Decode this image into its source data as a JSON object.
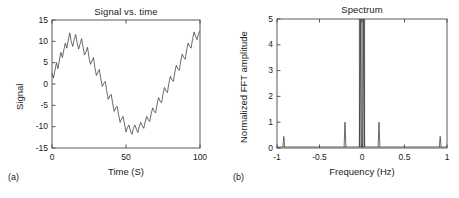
{
  "figure": {
    "panels": [
      {
        "tag": "(a)",
        "title": "Signal vs. time",
        "xlabel": "Time (S)",
        "ylabel": "Signal"
      },
      {
        "tag": "(b)",
        "title": "Spectrum",
        "xlabel": "Frequency (Hz)",
        "ylabel": "Normalized FFT amplitude"
      }
    ],
    "style": {
      "line_color": "#3a3a3a",
      "axis_color": "#4a4a4a",
      "background": "#ffffff"
    }
  },
  "chart_data": [
    {
      "type": "line",
      "id": "signal-vs-time",
      "title": "Signal vs. time",
      "xlabel": "Time (S)",
      "ylabel": "Signal",
      "xlim": [
        0,
        100
      ],
      "ylim": [
        -15,
        15
      ],
      "xticks": [
        0,
        50,
        100
      ],
      "xticklabels": [
        "0",
        "50",
        "100"
      ],
      "yticks": [
        -15,
        -10,
        -5,
        0,
        5,
        10,
        15
      ],
      "yticklabels": [
        "-15",
        "-10",
        "-5",
        "0",
        "5",
        "10",
        "15"
      ],
      "grid": false,
      "legend": null,
      "description": "Noisy sinusoid: ~0.02 Hz fundamental of amplitude ~10 plus a ~0.2 Hz ripple of amplitude ~2 and random noise.",
      "x": [
        0,
        1,
        2,
        3,
        4,
        5,
        6,
        7,
        8,
        9,
        10,
        11,
        12,
        13,
        14,
        15,
        16,
        17,
        18,
        19,
        20,
        21,
        22,
        23,
        24,
        25,
        26,
        27,
        28,
        29,
        30,
        31,
        32,
        33,
        34,
        35,
        36,
        37,
        38,
        39,
        40,
        41,
        42,
        43,
        44,
        45,
        46,
        47,
        48,
        49,
        50,
        51,
        52,
        53,
        54,
        55,
        56,
        57,
        58,
        59,
        60,
        61,
        62,
        63,
        64,
        65,
        66,
        67,
        68,
        69,
        70,
        71,
        72,
        73,
        74,
        75,
        76,
        77,
        78,
        79,
        80,
        81,
        82,
        83,
        84,
        85,
        86,
        87,
        88,
        89,
        90,
        91,
        92,
        93,
        94,
        95,
        96,
        97,
        98,
        99,
        100
      ],
      "y": [
        2.6,
        1.4,
        3.2,
        5.0,
        3.6,
        5.6,
        7.4,
        6.2,
        8.0,
        9.6,
        8.4,
        10.2,
        12.0,
        10.0,
        8.8,
        10.4,
        11.6,
        9.6,
        8.2,
        9.4,
        10.6,
        8.6,
        6.8,
        7.6,
        8.6,
        6.2,
        4.6,
        5.4,
        6.2,
        3.8,
        2.0,
        2.8,
        3.4,
        1.2,
        -0.6,
        0.2,
        0.6,
        -1.8,
        -3.6,
        -2.8,
        -2.4,
        -4.6,
        -6.4,
        -5.6,
        -5.2,
        -7.2,
        -9.0,
        -8.2,
        -7.6,
        -9.4,
        -11.2,
        -10.2,
        -9.6,
        -11.0,
        -11.8,
        -10.4,
        -9.6,
        -10.6,
        -11.4,
        -10.0,
        -9.0,
        -9.8,
        -10.4,
        -8.8,
        -7.6,
        -8.4,
        -8.8,
        -7.0,
        -5.6,
        -6.4,
        -6.8,
        -4.8,
        -3.2,
        -4.0,
        -4.4,
        -2.4,
        -0.8,
        -1.6,
        -2.0,
        0.2,
        1.8,
        1.0,
        0.6,
        2.8,
        4.4,
        3.6,
        3.2,
        5.4,
        7.0,
        6.2,
        5.8,
        8.0,
        9.6,
        8.8,
        8.4,
        10.6,
        12.2,
        11.2,
        10.4,
        11.8,
        12.4
      ]
    },
    {
      "type": "line",
      "id": "spectrum",
      "title": "Spectrum",
      "xlabel": "Frequency (Hz)",
      "ylabel": "Normalized FFT amplitude",
      "xlim": [
        -1,
        1
      ],
      "ylim": [
        0,
        5
      ],
      "xticks": [
        -1,
        -0.5,
        0,
        0.5,
        1
      ],
      "xticklabels": [
        "-1",
        "-0.5",
        "0",
        "0.5",
        "1"
      ],
      "yticks": [
        0,
        1,
        2,
        3,
        4,
        5
      ],
      "yticklabels": [
        "0",
        "1",
        "2",
        "3",
        "4",
        "5"
      ],
      "grid": false,
      "legend": null,
      "description": "Two-sided FFT magnitude. Large clipped pair of spikes at about -0.02 and +0.02 Hz reaching the top of the axis (5), a pair at -0.2 and +0.2 Hz of amplitude ~1.0, and a small pair at -0.9 and +0.9 Hz of amplitude ~0.45. Noise floor near 0.",
      "peaks": [
        {
          "frequency": -0.92,
          "amplitude": 0.45
        },
        {
          "frequency": -0.2,
          "amplitude": 1.0
        },
        {
          "frequency": -0.02,
          "amplitude": 5.0
        },
        {
          "frequency": 0.02,
          "amplitude": 5.0
        },
        {
          "frequency": 0.2,
          "amplitude": 1.0
        },
        {
          "frequency": 0.92,
          "amplitude": 0.45
        }
      ],
      "noise_floor": 0.04
    }
  ]
}
